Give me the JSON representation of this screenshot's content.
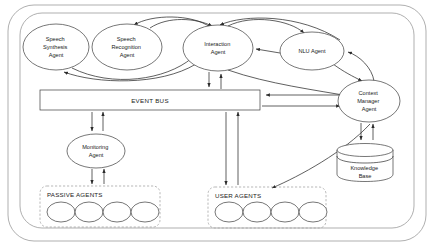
{
  "diagram": {
    "type": "architecture-block-diagram",
    "background_color": "#ffffff",
    "stroke_color": "#2b2b2b",
    "dashed_group_color": "#9a9a9a",
    "boundary_color": "#8c8c8c"
  },
  "boundaries": [
    {
      "name": "outer-system-boundary",
      "shape": "rounded-rectangle",
      "x": 8,
      "y": 5,
      "width": 418,
      "height": 236,
      "rx": 26
    },
    {
      "name": "inner-system-boundary",
      "shape": "rounded-rectangle",
      "x": 20,
      "y": 13,
      "width": 394,
      "height": 215,
      "rx": 22
    }
  ],
  "nodes": {
    "speech_synthesis_agent": {
      "label_lines": [
        "Speech",
        "Synthesis",
        "Agent"
      ],
      "shape": "ellipse",
      "cx": 56,
      "cy": 47,
      "rx": 33,
      "ry": 23
    },
    "speech_recognition_agent": {
      "label_lines": [
        "Speech",
        "Recognition",
        "Agent"
      ],
      "shape": "ellipse",
      "cx": 127,
      "cy": 47,
      "rx": 35,
      "ry": 23
    },
    "interaction_agent": {
      "label_lines": [
        "Interaction",
        "Agent"
      ],
      "shape": "ellipse",
      "cx": 218,
      "cy": 48,
      "rx": 35,
      "ry": 23
    },
    "nlu_agent": {
      "label_lines": [
        "NLU Agent"
      ],
      "shape": "ellipse",
      "cx": 312,
      "cy": 51,
      "rx": 32,
      "ry": 19
    },
    "context_manager_agent": {
      "label_lines": [
        "Context",
        "Manager",
        "Agent"
      ],
      "shape": "ellipse",
      "cx": 369,
      "cy": 101,
      "rx": 31,
      "ry": 21
    },
    "event_bus": {
      "label": "EVENT BUS",
      "shape": "rectangle",
      "x": 40,
      "y": 90,
      "width": 220,
      "height": 20
    },
    "monitoring_agent": {
      "label_lines": [
        "Monitoring",
        "Agent"
      ],
      "shape": "ellipse",
      "cx": 96,
      "cy": 151,
      "rx": 29,
      "ry": 17
    },
    "knowledge_base": {
      "label_lines": [
        "Knowledge",
        "Base"
      ],
      "shape": "cylinder",
      "x": 337,
      "y": 143,
      "width": 56,
      "height": 38
    }
  },
  "groups": [
    {
      "name": "passive-agents-group",
      "label": "PASSIVE AGENTS",
      "x": 40,
      "y": 186,
      "width": 120,
      "height": 41,
      "agent_count": 4,
      "agents": [
        {
          "cx": 61,
          "cy": 212,
          "rx": 14,
          "ry": 10
        },
        {
          "cx": 89,
          "cy": 212,
          "rx": 14,
          "ry": 10
        },
        {
          "cx": 117,
          "cy": 212,
          "rx": 14,
          "ry": 10
        },
        {
          "cx": 145,
          "cy": 212,
          "rx": 14,
          "ry": 10
        }
      ]
    },
    {
      "name": "user-agents-group",
      "label": "USER AGENTS",
      "x": 208,
      "y": 187,
      "width": 118,
      "height": 41,
      "agent_count": 4,
      "agents": [
        {
          "cx": 229,
          "cy": 212,
          "rx": 14,
          "ry": 10
        },
        {
          "cx": 257,
          "cy": 212,
          "rx": 14,
          "ry": 10
        },
        {
          "cx": 285,
          "cy": 212,
          "rx": 14,
          "ry": 10
        },
        {
          "cx": 313,
          "cy": 212,
          "rx": 14,
          "ry": 10
        }
      ]
    }
  ],
  "connections": [
    {
      "name": "speech-synthesis-to-interaction-arc",
      "from": "speech_synthesis_agent",
      "to": "interaction_agent",
      "style": "curved",
      "direction": "to"
    },
    {
      "name": "speech-recognition-to-interaction-arc",
      "from": "speech_recognition_agent",
      "to": "interaction_agent",
      "style": "curved",
      "direction": "to"
    },
    {
      "name": "interaction-to-speech-recognition-arc",
      "from": "interaction_agent",
      "to": "speech_recognition_agent",
      "style": "curved",
      "direction": "to"
    },
    {
      "name": "interaction-to-speech-synthesis-arc",
      "from": "interaction_agent",
      "to": "speech_synthesis_agent",
      "style": "curved",
      "direction": "to"
    },
    {
      "name": "interaction-to-nlu-arc",
      "from": "interaction_agent",
      "to": "nlu_agent",
      "style": "curved",
      "direction": "to"
    },
    {
      "name": "nlu-to-interaction-arrow",
      "from": "nlu_agent",
      "to": "interaction_agent",
      "style": "straight",
      "direction": "to"
    },
    {
      "name": "nlu-to-context-manager-arrow",
      "from": "nlu_agent",
      "to": "context_manager_agent",
      "style": "curved",
      "direction": "to"
    },
    {
      "name": "context-manager-to-nlu-arrow",
      "from": "context_manager_agent",
      "to": "nlu_agent",
      "style": "curved",
      "direction": "to"
    },
    {
      "name": "interaction-to-event-bus-arrow",
      "from": "interaction_agent",
      "to": "event_bus",
      "style": "straight",
      "direction": "to"
    },
    {
      "name": "event-bus-to-interaction-arrow",
      "from": "event_bus",
      "to": "interaction_agent",
      "style": "straight",
      "direction": "to"
    },
    {
      "name": "context-manager-to-event-bus-arrow",
      "from": "context_manager_agent",
      "to": "event_bus",
      "style": "straight",
      "direction": "to"
    },
    {
      "name": "event-bus-to-context-manager-arrow",
      "from": "event_bus",
      "to": "context_manager_agent",
      "style": "straight",
      "direction": "to"
    },
    {
      "name": "event-bus-to-monitoring-arrow",
      "from": "event_bus",
      "to": "monitoring_agent",
      "style": "straight",
      "direction": "to"
    },
    {
      "name": "monitoring-to-event-bus-arrow",
      "from": "monitoring_agent",
      "to": "event_bus",
      "style": "straight",
      "direction": "to"
    },
    {
      "name": "monitoring-to-passive-agents-arrow",
      "from": "monitoring_agent",
      "to": "passive_agents",
      "style": "straight",
      "direction": "to"
    },
    {
      "name": "passive-agents-to-monitoring-arrow",
      "from": "passive_agents",
      "to": "monitoring_agent",
      "style": "straight",
      "direction": "to"
    },
    {
      "name": "event-bus-to-user-agents-arrow",
      "from": "event_bus",
      "to": "user_agents",
      "style": "straight",
      "direction": "to"
    },
    {
      "name": "user-agents-to-event-bus-arrow",
      "from": "user_agents",
      "to": "event_bus",
      "style": "straight",
      "direction": "to"
    },
    {
      "name": "context-manager-to-user-agents-arrow",
      "from": "context_manager_agent",
      "to": "user_agents",
      "style": "curved",
      "direction": "to"
    },
    {
      "name": "context-manager-to-knowledge-base-arrow",
      "from": "context_manager_agent",
      "to": "knowledge_base",
      "style": "straight",
      "direction": "to"
    },
    {
      "name": "knowledge-base-to-context-manager-arrow",
      "from": "knowledge_base",
      "to": "context_manager_agent",
      "style": "straight",
      "direction": "to"
    },
    {
      "name": "interaction-to-context-manager-arc",
      "from": "interaction_agent",
      "to": "context_manager_agent",
      "style": "curved",
      "direction": "to"
    },
    {
      "name": "context-manager-to-interaction-arc",
      "from": "context_manager_agent",
      "to": "interaction_agent",
      "style": "curved",
      "direction": "to"
    }
  ]
}
